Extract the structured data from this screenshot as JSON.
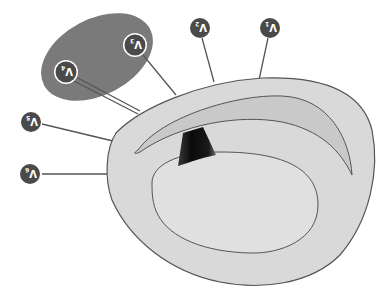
{
  "diagram": {
    "orientation": "rotated-180",
    "colors": {
      "background": "#ffffff",
      "myocardium": "#d9d9d9",
      "right_ventricle": "#cdcdcd",
      "lv_cavity": "#e0e0e0",
      "outline": "#555555",
      "precordial_zone": "#7a7a7a",
      "lead_marker": "#4a4a4a",
      "lead_ring": "#ffffff",
      "septum_wedge": "#111111",
      "leader_line": "#555555"
    },
    "leads": [
      {
        "id": "V1",
        "label": "V",
        "sub": "1"
      },
      {
        "id": "V2",
        "label": "V",
        "sub": "2"
      },
      {
        "id": "V3",
        "label": "V",
        "sub": "3"
      },
      {
        "id": "V4",
        "label": "V",
        "sub": "4"
      },
      {
        "id": "V5",
        "label": "V",
        "sub": "5"
      },
      {
        "id": "V6",
        "label": "V",
        "sub": "6"
      }
    ]
  }
}
